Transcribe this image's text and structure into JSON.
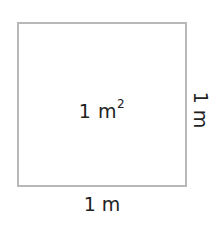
{
  "diagram": {
    "shape": "square",
    "area_label": {
      "value": "1",
      "unit": "m",
      "exponent": "2"
    },
    "bottom_label": "1 m",
    "side_label": "1 m",
    "colors": {
      "border": "#b8b8b8",
      "text": "#222222",
      "background": "#ffffff"
    }
  }
}
